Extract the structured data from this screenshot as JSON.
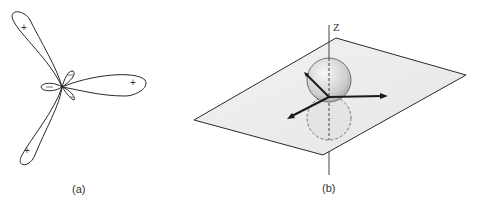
{
  "figure_a": {
    "caption": "(a)",
    "description": "Three-lobed polar orbital plot with small minor lobes",
    "lobe_signs": [
      "+",
      "+",
      "+"
    ],
    "minor_lobe_signs": [
      "−",
      "−",
      "−"
    ]
  },
  "figure_b": {
    "caption": "(b)",
    "axis_label": "Z",
    "description": "Plane with sphere centered at origin, upper half solid, lower half dashed, three vectors in the plane"
  },
  "colors": {
    "line": "#2a2a2a",
    "plane_fill": "#eeeeee",
    "sphere_fill": "#d8d8d8"
  }
}
